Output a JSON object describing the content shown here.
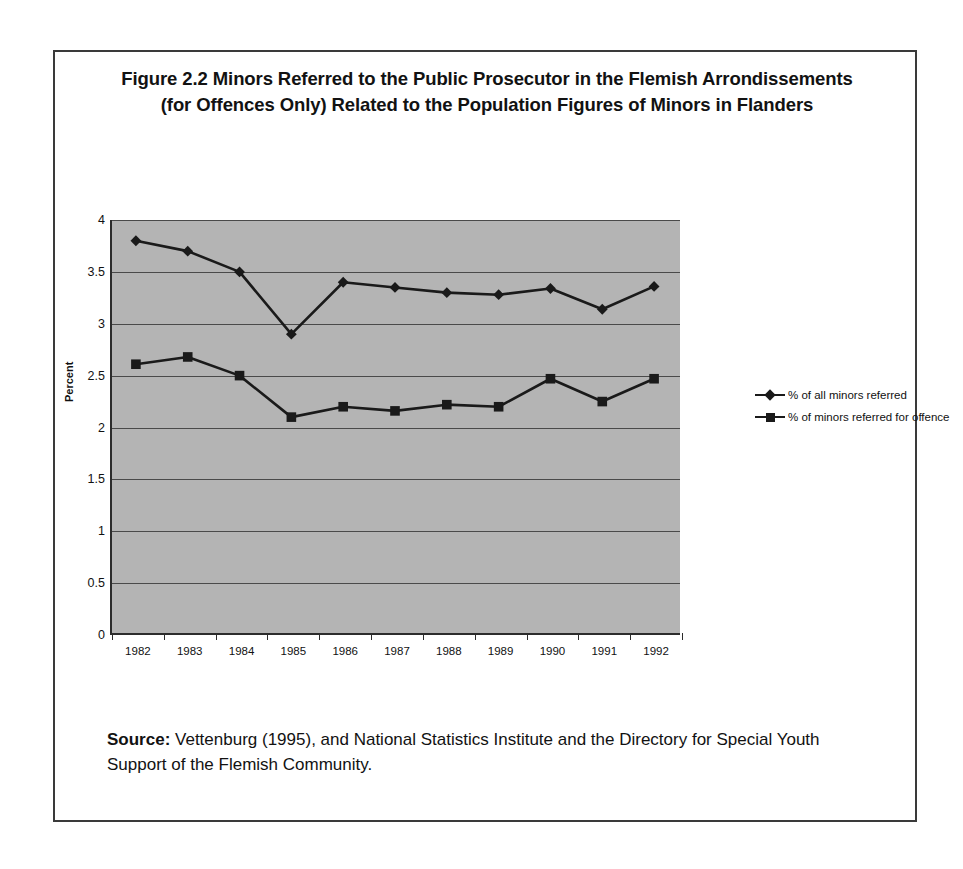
{
  "figure": {
    "title": "Figure 2.2 Minors Referred to the Public Prosecutor in the Flemish Arrondissements (for Offences Only) Related to the Population Figures of Minors in Flanders",
    "source_label": "Source:",
    "source_text": "Vettenburg (1995), and National Statistics Institute and the Directory for Special Youth Support of the Flemish Community."
  },
  "legend": {
    "position": "right",
    "entries": [
      {
        "marker": "diamond-marker-icon",
        "label": "% of all minors referred"
      },
      {
        "marker": "square-marker-icon",
        "label": "% of minors referred for offence"
      }
    ]
  },
  "axes": {
    "y_title": "Percent",
    "y_ticks": [
      "0",
      "0.5",
      "1",
      "1.5",
      "2",
      "2.5",
      "3",
      "3.5",
      "4"
    ],
    "x_ticks": [
      "1982",
      "1983",
      "1984",
      "1985",
      "1986",
      "1987",
      "1988",
      "1989",
      "1990",
      "1991",
      "1992"
    ]
  },
  "colors": {
    "plot_background": "#b4b4b4",
    "gridline": "#4a4a4a",
    "axis": "#2c2c2c",
    "series": "#1a1a1a",
    "frame": "#3a3a3a",
    "page_background": "#ffffff"
  },
  "chart_data": {
    "type": "line",
    "title": "Figure 2.2 Minors Referred to the Public Prosecutor in the Flemish Arrondissements (for Offences Only) Related to the Population Figures of Minors in Flanders",
    "xlabel": "",
    "ylabel": "Percent",
    "categories": [
      "1982",
      "1983",
      "1984",
      "1985",
      "1986",
      "1987",
      "1988",
      "1989",
      "1990",
      "1991",
      "1992"
    ],
    "series": [
      {
        "name": "% of all minors referred",
        "marker": "diamond",
        "values": [
          3.8,
          3.7,
          3.5,
          2.9,
          3.4,
          3.35,
          3.3,
          3.28,
          3.34,
          3.14,
          3.36
        ]
      },
      {
        "name": "% of minors referred for offence",
        "marker": "square",
        "values": [
          2.61,
          2.68,
          2.5,
          2.1,
          2.2,
          2.16,
          2.22,
          2.2,
          2.47,
          2.25,
          2.47
        ]
      }
    ],
    "ylim": [
      0,
      4
    ],
    "ytick_step": 0.5,
    "grid": true,
    "grid_axis": "y",
    "legend_position": "right"
  }
}
